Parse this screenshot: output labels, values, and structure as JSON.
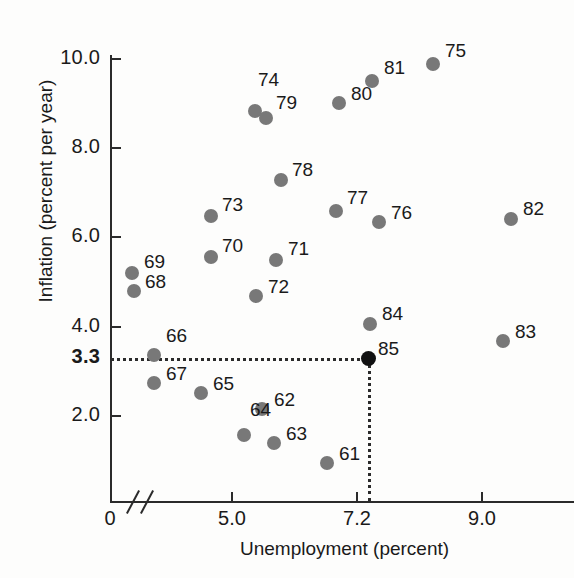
{
  "chart_data": {
    "type": "scatter",
    "title": "",
    "xlabel": "Unemployment (percent)",
    "ylabel": "Inflation (percent per year)",
    "xlim": [
      3.05,
      10.4
    ],
    "ylim": [
      0.0,
      10.9
    ],
    "grid": false,
    "legend": "none",
    "x_ticks": [
      {
        "label": "0",
        "value": 0.0,
        "px": 110,
        "has_mark": false
      },
      {
        "label": "5.0",
        "value": 5.0,
        "px": 232,
        "has_mark": true
      },
      {
        "label": "7.2",
        "value": 7.2,
        "px": 357,
        "has_mark": true
      },
      {
        "label": "9.0",
        "value": 9.0,
        "px": 482,
        "has_mark": true
      }
    ],
    "y_ticks": [
      {
        "label": "10.0",
        "value": 10.0,
        "px": 59,
        "has_mark": true,
        "bold": false
      },
      {
        "label": "8.0",
        "value": 8.0,
        "px": 148,
        "has_mark": true,
        "bold": false
      },
      {
        "label": "6.0",
        "value": 6.0,
        "px": 237,
        "has_mark": true,
        "bold": false
      },
      {
        "label": "4.0",
        "value": 4.0,
        "px": 327,
        "has_mark": true,
        "bold": false
      },
      {
        "label": "3.3",
        "value": 3.3,
        "px": 358,
        "has_mark": false,
        "bold": true
      },
      {
        "label": "2.0",
        "value": 2.0,
        "px": 416,
        "has_mark": true,
        "bold": false
      }
    ],
    "axis_break": {
      "present": true,
      "axis": "x",
      "note": "double slash break near origin"
    },
    "annotations": {
      "horizontal_guide": {
        "y_value": 3.3,
        "from_x": 110,
        "to_x": 368
      },
      "vertical_guide": {
        "x_value": 7.2,
        "from_y": 358,
        "to_y": 501
      }
    },
    "points": [
      {
        "label": "61",
        "x": 6.52,
        "y": 1.0,
        "px": 327,
        "py": 463,
        "lx": 12,
        "ly": -20,
        "highlight": false
      },
      {
        "label": "62",
        "x": 5.48,
        "y": 2.22,
        "px": 262,
        "py": 409,
        "lx": 12,
        "ly": -20,
        "highlight": false
      },
      {
        "label": "63",
        "x": 5.67,
        "y": 1.45,
        "px": 274,
        "py": 443,
        "lx": 12,
        "ly": -20,
        "highlight": false
      },
      {
        "label": "64",
        "x": 5.19,
        "y": 1.63,
        "px": 244,
        "py": 435,
        "lx": 6,
        "ly": -36,
        "highlight": false
      },
      {
        "label": "65",
        "x": 4.5,
        "y": 2.58,
        "px": 201,
        "py": 393,
        "lx": 12,
        "ly": -20,
        "highlight": false
      },
      {
        "label": "66",
        "x": 5.02,
        "y": 3.3,
        "px": 154,
        "py": 355,
        "lx": 12,
        "ly": -30,
        "highlight": false
      },
      {
        "label": "67",
        "x": 4.95,
        "y": 2.68,
        "px": 154,
        "py": 383,
        "lx": 12,
        "ly": -20,
        "highlight": false
      },
      {
        "label": "68",
        "x": 3.4,
        "y": 4.61,
        "px": 134,
        "py": 291,
        "lx": 11,
        "ly": -20,
        "highlight": false
      },
      {
        "label": "69",
        "x": 3.37,
        "y": 5.02,
        "px": 132,
        "py": 273,
        "lx": 12,
        "ly": -22,
        "highlight": false
      },
      {
        "label": "70",
        "x": 4.66,
        "y": 5.64,
        "px": 211,
        "py": 257,
        "lx": 11,
        "ly": -22,
        "highlight": false
      },
      {
        "label": "71",
        "x": 5.7,
        "y": 5.57,
        "px": 276,
        "py": 260,
        "lx": 12,
        "ly": -22,
        "highlight": false
      },
      {
        "label": "72",
        "x": 5.38,
        "y": 4.76,
        "px": 256,
        "py": 296,
        "lx": 12,
        "ly": -20,
        "highlight": false
      },
      {
        "label": "73",
        "x": 4.66,
        "y": 6.56,
        "px": 211,
        "py": 216,
        "lx": 11,
        "ly": -22,
        "highlight": false
      },
      {
        "label": "74",
        "x": 5.37,
        "y": 8.83,
        "px": 255,
        "py": 111,
        "lx": 3,
        "ly": -42,
        "highlight": false
      },
      {
        "label": "79",
        "x": 5.54,
        "y": 8.67,
        "px": 266,
        "py": 118,
        "lx": 10,
        "ly": -26,
        "highlight": false
      },
      {
        "label": "75",
        "x": 8.22,
        "y": 9.88,
        "px": 433,
        "py": 64,
        "lx": 12,
        "ly": -24,
        "highlight": false
      },
      {
        "label": "76",
        "x": 7.35,
        "y": 6.31,
        "px": 379,
        "py": 222,
        "lx": 12,
        "ly": -20,
        "highlight": false
      },
      {
        "label": "77",
        "x": 6.66,
        "y": 6.58,
        "px": 336,
        "py": 211,
        "lx": 11,
        "ly": -24,
        "highlight": false
      },
      {
        "label": "78",
        "x": 5.78,
        "y": 7.28,
        "px": 281,
        "py": 180,
        "lx": 11,
        "ly": -21,
        "highlight": false
      },
      {
        "label": "80",
        "x": 6.71,
        "y": 9.01,
        "px": 339,
        "py": 103,
        "lx": 12,
        "ly": -20,
        "highlight": false
      },
      {
        "label": "81",
        "x": 7.24,
        "y": 9.51,
        "px": 372,
        "py": 81,
        "lx": 12,
        "ly": -24,
        "highlight": false
      },
      {
        "label": "82",
        "x": 9.46,
        "y": 6.39,
        "px": 511,
        "py": 219,
        "lx": 12,
        "ly": -21,
        "highlight": false
      },
      {
        "label": "83",
        "x": 9.34,
        "y": 3.66,
        "px": 503,
        "py": 341,
        "lx": 12,
        "ly": -20,
        "highlight": false
      },
      {
        "label": "84",
        "x": 7.21,
        "y": 4.04,
        "px": 370,
        "py": 324,
        "lx": 12,
        "ly": -21,
        "highlight": false
      },
      {
        "label": "85",
        "x": 7.2,
        "y": 3.3,
        "px": 368,
        "py": 358,
        "lx": 10,
        "ly": -20,
        "highlight": true
      }
    ]
  }
}
